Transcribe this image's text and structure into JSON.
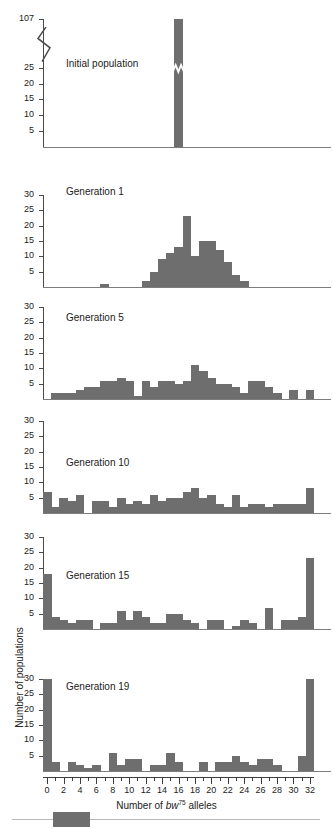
{
  "figure": {
    "axis_x_title_prefix": "Number of ",
    "axis_x_gene": "bw",
    "axis_x_gene_sup": "75",
    "axis_x_title_suffix": " alleles",
    "axis_y_title": "Number of populations",
    "bar_color": "#6e6e6e",
    "axis_color": "#3d3d3d"
  },
  "chart_data": {
    "type": "bar",
    "title": "Number of bw75 alleles",
    "xlabel": "Number of bw75 alleles",
    "ylabel": "Number of populations",
    "xlim": [
      0,
      32
    ],
    "x_tick_step": 1,
    "x_label_step": 2,
    "grid": false,
    "legend": "none",
    "x": [
      0,
      1,
      2,
      3,
      4,
      5,
      6,
      7,
      8,
      9,
      10,
      11,
      12,
      13,
      14,
      15,
      16,
      17,
      18,
      19,
      20,
      21,
      22,
      23,
      24,
      25,
      26,
      27,
      28,
      29,
      30,
      31,
      32
    ],
    "x_tick_labels": [
      "0",
      "2",
      "4",
      "6",
      "8",
      "10",
      "12",
      "14",
      "16",
      "18",
      "20",
      "22",
      "24",
      "26",
      "28",
      "30",
      "32"
    ],
    "panels": [
      {
        "name": "Initial population",
        "ylim": [
          0,
          107
        ],
        "y_tick_labels": [
          "5",
          "10",
          "15",
          "20",
          "25",
          "107"
        ],
        "y_ticks": [
          5,
          10,
          15,
          20,
          25,
          107
        ],
        "axis_break": true,
        "axis_break_between": [
          25,
          107
        ],
        "values": [
          0,
          0,
          0,
          0,
          0,
          0,
          0,
          0,
          0,
          0,
          0,
          0,
          0,
          0,
          0,
          0,
          107,
          0,
          0,
          0,
          0,
          0,
          0,
          0,
          0,
          0,
          0,
          0,
          0,
          0,
          0,
          0,
          0
        ]
      },
      {
        "name": "Generation 1",
        "ylim": [
          0,
          30
        ],
        "y_tick_labels": [
          "5",
          "10",
          "15",
          "20",
          "25",
          "30"
        ],
        "y_ticks": [
          5,
          10,
          15,
          20,
          25,
          30
        ],
        "axis_break": false,
        "values": [
          0,
          0,
          0,
          0,
          0,
          0,
          0,
          1,
          0,
          0,
          0,
          0,
          2,
          5,
          9,
          11,
          13,
          23,
          10,
          15,
          15,
          12,
          8,
          4,
          2,
          0,
          0,
          0,
          0,
          0,
          0,
          0,
          0
        ]
      },
      {
        "name": "Generation 5",
        "ylim": [
          0,
          30
        ],
        "y_tick_labels": [
          "5",
          "10",
          "15",
          "20",
          "25",
          "30"
        ],
        "y_ticks": [
          5,
          10,
          15,
          20,
          25,
          30
        ],
        "axis_break": false,
        "values": [
          0,
          2,
          2,
          2,
          3,
          4,
          4,
          6,
          6,
          7,
          6,
          1,
          6,
          4,
          6,
          6,
          5,
          6,
          11,
          9,
          7,
          5,
          5,
          4,
          2,
          6,
          6,
          4,
          2,
          0,
          3,
          0,
          3
        ]
      },
      {
        "name": "Generation 10",
        "ylim": [
          0,
          30
        ],
        "y_tick_labels": [
          "5",
          "10",
          "15",
          "20",
          "25",
          "30"
        ],
        "y_ticks": [
          5,
          10,
          15,
          20,
          25,
          30
        ],
        "axis_break": false,
        "values": [
          7,
          2,
          5,
          4,
          6,
          0,
          4,
          4,
          2,
          5,
          3,
          4,
          3,
          6,
          4,
          5,
          5,
          7,
          8,
          5,
          6,
          3,
          2,
          6,
          2,
          3,
          3,
          2,
          3,
          3,
          3,
          3,
          8
        ]
      },
      {
        "name": "Generation 15",
        "ylim": [
          0,
          30
        ],
        "y_tick_labels": [
          "5",
          "10",
          "15",
          "20",
          "25",
          "30"
        ],
        "y_ticks": [
          5,
          10,
          15,
          20,
          25,
          30
        ],
        "axis_break": false,
        "values": [
          18,
          4,
          3,
          2,
          3,
          3,
          0,
          2,
          2,
          6,
          3,
          6,
          4,
          2,
          2,
          5,
          5,
          3,
          2,
          0,
          3,
          3,
          0,
          1,
          3,
          2,
          0,
          7,
          0,
          3,
          3,
          4,
          23
        ]
      },
      {
        "name": "Generation 19",
        "ylim": [
          0,
          30
        ],
        "y_tick_labels": [
          "5",
          "10",
          "15",
          "20",
          "25",
          "30"
        ],
        "y_ticks": [
          5,
          10,
          15,
          20,
          25,
          30
        ],
        "axis_break": false,
        "values": [
          30,
          3,
          0,
          3,
          2,
          1,
          2,
          0,
          6,
          2,
          4,
          4,
          0,
          2,
          2,
          6,
          3,
          0,
          0,
          3,
          0,
          3,
          3,
          5,
          3,
          2,
          4,
          4,
          2,
          0,
          0,
          5,
          30
        ]
      }
    ]
  }
}
